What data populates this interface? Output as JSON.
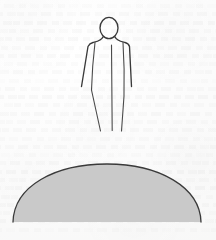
{
  "canvas": {
    "width": 216,
    "height": 240,
    "background_color": "#fdfdfd",
    "media": "scanned book page with show-through text"
  },
  "artwork": {
    "title": "Standing human figure above a dome",
    "style": "ink line drawing",
    "line_color": "#3a3a3a",
    "elements": [
      {
        "name": "human-figure",
        "type": "line-drawing",
        "description": "Standing frontal human outline: oval head, sloping shoulders, arms hanging down and slightly outward, tapering body with a vertical centre line dividing the legs",
        "stroke_color": "#3a3a3a",
        "fill": "none",
        "bbox": [
          78,
          17,
          56,
          115
        ]
      },
      {
        "name": "head",
        "type": "ellipse-outline",
        "center": [
          109,
          28
        ],
        "radius_x": 9,
        "radius_y": 10.5,
        "stroke_color": "#3a3a3a",
        "fill": "none"
      },
      {
        "name": "dome",
        "type": "filled-half-ellipse",
        "description": "Large gray dome / hill with flat base",
        "fill_color": "#c9c9c9",
        "stroke_color": "#3a3a3a",
        "left_x": 13,
        "right_x": 201,
        "top_y": 164,
        "base_y": 222,
        "width": 188,
        "height": 58
      }
    ]
  },
  "ghost_text": {
    "description": "faint bleed-through text lines from the reverse side of the page",
    "line_count": 28,
    "color": "rgba(120,120,118,0.085)",
    "visible": true
  }
}
